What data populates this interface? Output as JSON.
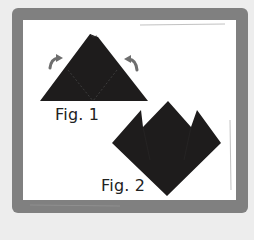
{
  "figures": [
    {
      "id": "fig1",
      "label": "Fig. 1",
      "description": "Folded triangle with two dashed fold lines and curved arrows indicating folding the corners up"
    },
    {
      "id": "fig2",
      "label": "Fig. 2",
      "description": "Diamond shape with three pointed peaks after folding corners up"
    }
  ],
  "colors": {
    "background": "#ededed",
    "frame": "#808080",
    "panel": "#ffffff",
    "paper": "#1e1c1c",
    "arrow": "#6e6e6e",
    "text": "#222222"
  }
}
